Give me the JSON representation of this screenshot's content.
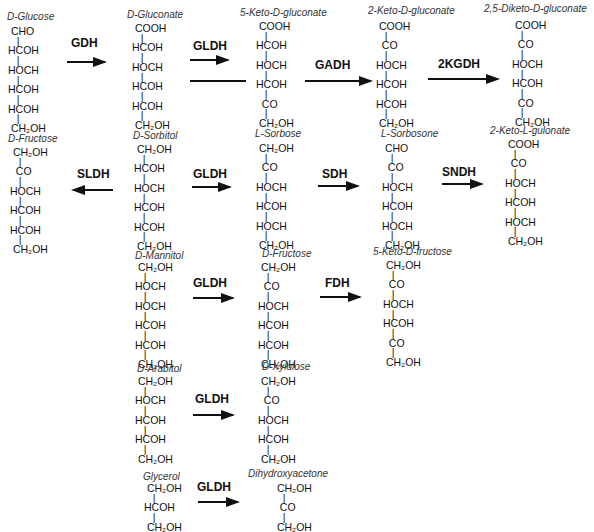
{
  "compounds": {
    "d_glucose": {
      "name": "D-Glucose",
      "formula": " CHO\n   |\nHCOH\n   |\nHOCH\n   |\nHCOH\n   |\nHCOH\n   |\n CH₂OH"
    },
    "d_gluconate": {
      "name": "D-Gluconate",
      "formula": " COOH\n   |\nHCOH\n   |\nHOCH\n   |\nHCOH\n   |\nHCOH\n   |\n CH₂OH"
    },
    "keto5_d_gluconate": {
      "name": "5-Keto-D-gluconate",
      "formula": " COOH\n   |\nHCOH\n   |\nHOCH\n   |\nHCOH\n   |\n  CO\n   |\n CH₂OH"
    },
    "keto2_d_gluconate": {
      "name": "2-Keto-D-gluconate",
      "formula": " COOH\n   |\n  CO\n   |\nHOCH\n   |\nHCOH\n   |\nHCOH\n   |\n CH₂OH"
    },
    "diketo25_d_gluconate": {
      "name": "2,5-Diketo-D-gluconate",
      "formula": " COOH\n   |\n  CO\n   |\nHOCH\n   |\nHCOH\n   |\n  CO\n   |\n CH₂OH"
    },
    "d_fructose_1": {
      "name": "D-Fructose",
      "formula": " CH₂OH\n   |\n  CO\n   |\nHOCH\n   |\nHCOH\n   |\nHCOH\n   |\n CH₂OH"
    },
    "d_sorbitol": {
      "name": "D-Sorbitol",
      "formula": " CH₂OH\n   |\nHCOH\n   |\nHOCH\n   |\nHCOH\n   |\nHCOH\n   |\n CH₂OH"
    },
    "l_sorbose": {
      "name": "L-Sorbose",
      "formula": " CH₂OH\n   |\n  CO\n   |\nHOCH\n   |\nHCOH\n   |\nHOCH\n   |\n CH₂OH"
    },
    "l_sorbosone": {
      "name": "L-Sorbosone",
      "formula": " CHO\n   |\n  CO\n   |\nHOCH\n   |\nHCOH\n   |\nHOCH\n   |\n CH₂OH"
    },
    "keto2_l_gulonate": {
      "name": "2-Keto-L-gulonate",
      "formula": " COOH\n   |\n  CO\n   |\nHOCH\n   |\nHCOH\n   |\nHOCH\n   |\n CH₂OH"
    },
    "d_mannitol": {
      "name": "D-Mannitol",
      "formula": " CH₂OH\n   |\nHOCH\n   |\nHOCH\n   |\nHCOH\n   |\nHCOH\n   |\n CH₂OH"
    },
    "d_fructose_2": {
      "name": "D-Fructose",
      "formula": " CH₂OH\n   |\n  CO\n   |\nHOCH\n   |\nHCOH\n   |\nHCOH\n   |\n CH₂OH"
    },
    "keto5_d_fructose": {
      "name": "5-Keto-D-fructose",
      "formula": " CH₂OH\n   |\n  CO\n   |\nHOCH\n   |\nHCOH\n   |\n  CO\n   |\n CH₂OH"
    },
    "d_arabitol": {
      "name": "D-Arabitol",
      "formula": " CH₂OH\n   |\nHOCH\n   |\nHCOH\n   |\nHCOH\n   |\n CH₂OH"
    },
    "d_xylulose": {
      "name": "D-Xylulose",
      "formula": " CH₂OH\n   |\n  CO\n   |\nHOCH\n   |\nHCOH\n   |\n CH₂OH"
    },
    "glycerol": {
      "name": "Glycerol",
      "formula": " CH₂OH\n   |\nHCOH\n   |\n CH₂OH"
    },
    "dihydroxyacetone": {
      "name": "Dihydroxyacetone",
      "formula": " CH₂OH\n   |\n  CO\n   |\n CH₂OH"
    }
  },
  "enzymes": {
    "gdh": "GDH",
    "gldh_r1": "GLDH",
    "gadh": "GADH",
    "kgdh2": "2KGDH",
    "sldh": "SLDH",
    "gldh_r2": "GLDH",
    "sdh": "SDH",
    "sndh": "SNDH",
    "gldh_r3": "GLDH",
    "fdh": "FDH",
    "gldh_r4": "GLDH",
    "gldh_r5": "GLDH"
  }
}
